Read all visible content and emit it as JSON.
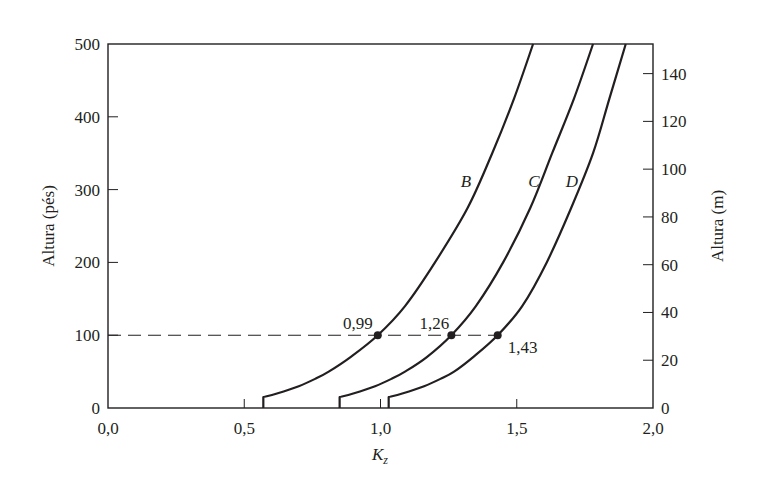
{
  "chart_data": {
    "type": "line",
    "title": "",
    "xlabel": "K_z",
    "xlabel_main": "K",
    "xlabel_sub": "z",
    "ylabel_left": "Altura (pés)",
    "ylabel_right": "Altura (m)",
    "xlim": [
      0.0,
      2.0
    ],
    "ylim_left": [
      0,
      500
    ],
    "ylim_right_m": [
      0,
      152.4
    ],
    "grid": false,
    "legend": "none (inline curve labels)",
    "x_ticks": [
      "0,0",
      "0,5",
      "1,0",
      "1,5",
      "2,0"
    ],
    "x_tick_values": [
      0.0,
      0.5,
      1.0,
      1.5,
      2.0
    ],
    "y_left_ticks": [
      "0",
      "100",
      "200",
      "300",
      "400",
      "500"
    ],
    "y_left_tick_values": [
      0,
      100,
      200,
      300,
      400,
      500
    ],
    "y_right_ticks": [
      "0",
      "20",
      "40",
      "60",
      "80",
      "100",
      "120",
      "140"
    ],
    "y_right_tick_values_m": [
      0,
      20,
      40,
      60,
      80,
      100,
      120,
      140
    ],
    "series": [
      {
        "name": "B",
        "label": "B",
        "points_ft": [
          [
            0.57,
            0
          ],
          [
            0.57,
            15
          ],
          [
            0.62,
            20
          ],
          [
            0.7,
            30
          ],
          [
            0.76,
            40
          ],
          [
            0.81,
            50
          ],
          [
            0.89,
            70
          ],
          [
            0.99,
            100
          ],
          [
            1.09,
            140
          ],
          [
            1.2,
            200
          ],
          [
            1.32,
            275
          ],
          [
            1.41,
            350
          ],
          [
            1.49,
            425
          ],
          [
            1.56,
            500
          ]
        ]
      },
      {
        "name": "C",
        "label": "C",
        "points_ft": [
          [
            0.85,
            0
          ],
          [
            0.85,
            15
          ],
          [
            0.9,
            20
          ],
          [
            0.98,
            30
          ],
          [
            1.04,
            40
          ],
          [
            1.09,
            50
          ],
          [
            1.17,
            70
          ],
          [
            1.26,
            100
          ],
          [
            1.35,
            140
          ],
          [
            1.45,
            200
          ],
          [
            1.55,
            275
          ],
          [
            1.63,
            350
          ],
          [
            1.71,
            425
          ],
          [
            1.78,
            500
          ]
        ]
      },
      {
        "name": "D",
        "label": "D",
        "points_ft": [
          [
            1.03,
            0
          ],
          [
            1.03,
            15
          ],
          [
            1.08,
            20
          ],
          [
            1.16,
            30
          ],
          [
            1.22,
            40
          ],
          [
            1.27,
            50
          ],
          [
            1.34,
            70
          ],
          [
            1.43,
            100
          ],
          [
            1.52,
            140
          ],
          [
            1.61,
            200
          ],
          [
            1.7,
            275
          ],
          [
            1.78,
            350
          ],
          [
            1.84,
            425
          ],
          [
            1.9,
            500
          ]
        ]
      }
    ],
    "reference_line": {
      "y_ft": 100,
      "style": "dashed",
      "x_from": 0.0,
      "x_to": 1.43
    },
    "annotations": [
      {
        "text": "0,99",
        "x": 0.99,
        "y_ft": 100,
        "curve": "B"
      },
      {
        "text": "1,26",
        "x": 1.26,
        "y_ft": 100,
        "curve": "C"
      },
      {
        "text": "1,43",
        "x": 1.43,
        "y_ft": 100,
        "curve": "D"
      }
    ]
  },
  "colors": {
    "ink": "#231f20",
    "background": "#ffffff"
  }
}
